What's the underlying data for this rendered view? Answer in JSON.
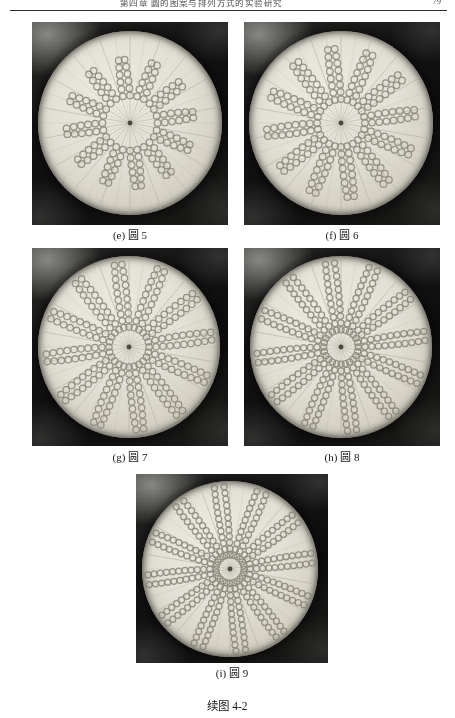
{
  "page": {
    "running_head": "第四章 圆的图案与排列方式的实验研究",
    "page_number": "79",
    "figure_caption": "续图 4-2"
  },
  "panels": [
    {
      "id": "e",
      "caption": "(e) 圆 5",
      "label_letter": "(e)",
      "label_name": "圆 5",
      "frame": {
        "x": 32,
        "y": 22,
        "w": 196,
        "h": 203
      },
      "disc": {
        "cx": 98,
        "cy": 101,
        "r": 92
      },
      "spokes": 36,
      "chain": {
        "start_ratio": 0.3,
        "beads": 6,
        "bead_r": 3.3,
        "spacing": 7.2
      },
      "chains": 24,
      "caption_y": 228
    },
    {
      "id": "f",
      "caption": "(f) 圆 6",
      "label_letter": "(f)",
      "label_name": "圆 6",
      "frame": {
        "x": 244,
        "y": 22,
        "w": 196,
        "h": 203
      },
      "disc": {
        "cx": 97,
        "cy": 101,
        "r": 92
      },
      "spokes": 36,
      "chain": {
        "start_ratio": 0.26,
        "beads": 8,
        "bead_r": 3.3,
        "spacing": 7.2
      },
      "chains": 24,
      "caption_y": 228
    },
    {
      "id": "g",
      "caption": "(g) 圆 7",
      "label_letter": "(g)",
      "label_name": "圆 7",
      "frame": {
        "x": 32,
        "y": 248,
        "w": 196,
        "h": 198
      },
      "disc": {
        "cx": 97,
        "cy": 99,
        "r": 91
      },
      "spokes": 36,
      "chain": {
        "start_ratio": 0.22,
        "beads": 10,
        "bead_r": 3.2,
        "spacing": 7.0
      },
      "chains": 24,
      "caption_y": 450
    },
    {
      "id": "h",
      "caption": "(h) 圆 8",
      "label_letter": "(h)",
      "label_name": "圆 8",
      "frame": {
        "x": 244,
        "y": 248,
        "w": 196,
        "h": 198
      },
      "disc": {
        "cx": 97,
        "cy": 99,
        "r": 91
      },
      "spokes": 36,
      "chain": {
        "start_ratio": 0.19,
        "beads": 12,
        "bead_r": 3.1,
        "spacing": 6.7
      },
      "chains": 24,
      "caption_y": 450
    },
    {
      "id": "i",
      "caption": "(i) 圆 9",
      "label_letter": "(i)",
      "label_name": "圆 9",
      "frame": {
        "x": 136,
        "y": 474,
        "w": 192,
        "h": 189
      },
      "disc": {
        "cx": 94,
        "cy": 95,
        "r": 88
      },
      "spokes": 36,
      "chain": {
        "start_ratio": 0.16,
        "beads": 14,
        "bead_r": 3.0,
        "spacing": 6.2
      },
      "chains": 24,
      "caption_y": 666
    }
  ],
  "figure_caption_y": 697,
  "colors": {
    "disc": "#e3e0d5",
    "bead_stroke": "#8d8a7c",
    "spoke": "#b4b0a2",
    "photo_bg": "#111111",
    "text": "#1a1a1a"
  }
}
